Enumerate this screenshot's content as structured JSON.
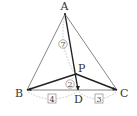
{
  "diagram": {
    "points": {
      "A": {
        "label": "A",
        "x": 65,
        "y": 14
      },
      "B": {
        "label": "B",
        "x": 27,
        "y": 90
      },
      "C": {
        "label": "C",
        "x": 117,
        "y": 90
      },
      "P": {
        "label": "P",
        "x": 76,
        "y": 74
      },
      "D": {
        "label": "D",
        "x": 78,
        "y": 90
      }
    },
    "ratios": {
      "AP": "7",
      "PD": "2",
      "BD": "4",
      "DC": "3"
    },
    "colors": {
      "thin_line": "#555555",
      "thick_line": "#222222",
      "dotted": "#999999"
    }
  }
}
